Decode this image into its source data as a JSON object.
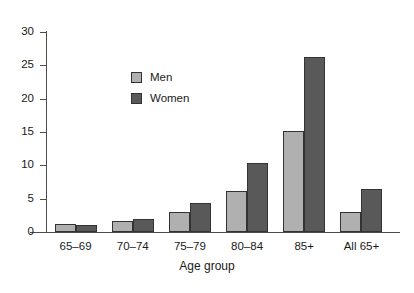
{
  "chart_data": {
    "type": "bar",
    "title": "",
    "subtitle": "",
    "xlabel": "Age group",
    "ylabel": "",
    "ylim": [
      0,
      30
    ],
    "yticks": [
      0,
      5,
      10,
      15,
      20,
      25,
      30
    ],
    "ytick_labels": [
      "0",
      "5",
      "10",
      "15",
      "20",
      "25",
      "30"
    ],
    "grid": false,
    "legend_position": "inside-upper-left",
    "categories": [
      "65–69",
      "70–74",
      "75–79",
      "80–84",
      "85+",
      "All 65+"
    ],
    "series": [
      {
        "name": "Men",
        "color": "#b0b0b0",
        "values": [
          1.2,
          1.6,
          3.0,
          6.2,
          15.2,
          3.0
        ]
      },
      {
        "name": "Women",
        "color": "#595959",
        "values": [
          1.1,
          1.9,
          4.3,
          10.3,
          26.3,
          6.4
        ]
      }
    ],
    "annotations": []
  },
  "legend": {
    "entries": [
      {
        "label": "Men"
      },
      {
        "label": "Women"
      }
    ]
  },
  "colors": {
    "men": "#b0b0b0",
    "women": "#595959",
    "axis": "#4d4d4d",
    "bar_outline": "#333333",
    "background": "#ffffff",
    "text": "#1a1a1a"
  }
}
